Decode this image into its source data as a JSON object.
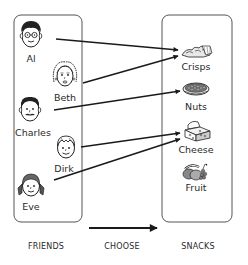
{
  "diagram": {
    "friends_group": {
      "caption": "FRIENDS",
      "items": [
        {
          "name": "Al",
          "icon": "man-with-glasses-face-icon"
        },
        {
          "name": "Beth",
          "icon": "woman-curly-hair-face-icon"
        },
        {
          "name": "Charles",
          "icon": "man-with-mustache-face-icon"
        },
        {
          "name": "Dirk",
          "icon": "boy-face-icon"
        },
        {
          "name": "Eve",
          "icon": "girl-with-pigtails-face-icon"
        }
      ]
    },
    "relation": {
      "caption": "CHOOSE",
      "arrow_icon": "right-arrow-icon"
    },
    "snacks_group": {
      "caption": "SNACKS",
      "items": [
        {
          "name": "Crisps",
          "icon": "crisps-icon"
        },
        {
          "name": "Nuts",
          "icon": "nuts-bowl-icon"
        },
        {
          "name": "Cheese",
          "icon": "cheese-icon"
        },
        {
          "name": "Fruit",
          "icon": "fruit-icon"
        }
      ]
    },
    "mappings": [
      {
        "from": "Al",
        "to": "Crisps"
      },
      {
        "from": "Beth",
        "to": "Crisps"
      },
      {
        "from": "Charles",
        "to": "Nuts"
      },
      {
        "from": "Dirk",
        "to": "Cheese"
      },
      {
        "from": "Eve",
        "to": "Cheese"
      }
    ],
    "colors": {
      "line": "#1a1a1a",
      "box_border": "#555555",
      "text": "#2a2a2a"
    }
  }
}
